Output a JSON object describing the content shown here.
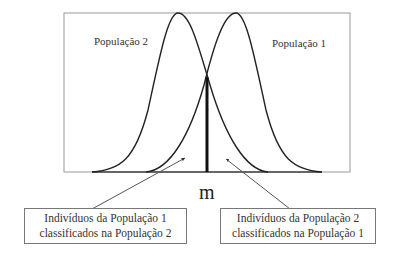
{
  "diagram": {
    "title": "",
    "curves": [
      {
        "name": "População 2",
        "peak_x": 178,
        "position": "left"
      },
      {
        "name": "População 1",
        "peak_x": 236,
        "position": "right"
      }
    ],
    "threshold_label": "m",
    "labels": {
      "pop2": "População 2",
      "pop1": "População 1"
    },
    "boxes": [
      {
        "line1": "Indivíduos da População 1",
        "line2": "classificados na População 2"
      },
      {
        "line1": "Indivíduos da População 2",
        "line2": "classificados na População 1"
      }
    ]
  }
}
